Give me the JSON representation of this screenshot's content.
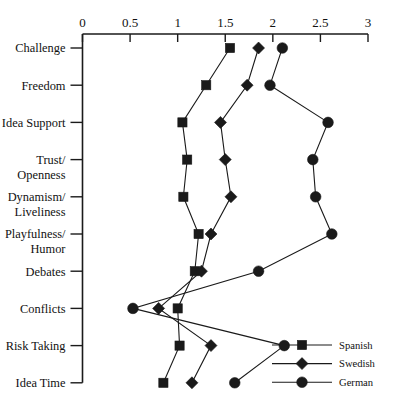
{
  "chart_data": {
    "type": "line",
    "title": "",
    "xlabel": "",
    "ylabel": "",
    "orientation": "horizontal",
    "grid": false,
    "legend_position": "bottom-right",
    "xlim": [
      0,
      3
    ],
    "xticks": [
      0,
      0.5,
      1,
      1.5,
      2,
      2.5,
      3
    ],
    "xtick_labels": [
      "0",
      "0.5",
      "1",
      "1.5",
      "2",
      "2.5",
      "3"
    ],
    "categories": [
      "Challenge",
      "Freedom",
      "Idea Support",
      "Trust/ Openness",
      "Dynamism/ Liveliness",
      "Playfulness/ Humor",
      "Debates",
      "Conflicts",
      "Risk Taking",
      "Idea Time"
    ],
    "category_lines": [
      [
        "Challenge"
      ],
      [
        "Freedom"
      ],
      [
        "Idea Support"
      ],
      [
        "Trust/",
        "Openness"
      ],
      [
        "Dynamism/",
        "Liveliness"
      ],
      [
        "Playfulness/",
        "Humor"
      ],
      [
        "Debates"
      ],
      [
        "Conflicts"
      ],
      [
        "Risk Taking"
      ],
      [
        "Idea Time"
      ]
    ],
    "series": [
      {
        "name": "Spanish",
        "marker": "square",
        "color": "#1a1a1a",
        "values": [
          1.55,
          1.3,
          1.05,
          1.1,
          1.06,
          1.22,
          1.18,
          1.0,
          1.02,
          0.85
        ]
      },
      {
        "name": "Swedish",
        "marker": "diamond",
        "color": "#1a1a1a",
        "values": [
          1.85,
          1.73,
          1.45,
          1.5,
          1.56,
          1.35,
          1.25,
          0.8,
          1.35,
          1.15
        ]
      },
      {
        "name": "German",
        "marker": "circle",
        "color": "#1a1a1a",
        "values": [
          2.1,
          1.97,
          2.58,
          2.42,
          2.45,
          2.62,
          1.85,
          0.53,
          2.12,
          1.6
        ]
      }
    ]
  },
  "legend": {
    "entries": [
      {
        "label": "Spanish",
        "marker": "square-marker"
      },
      {
        "label": "Swedish",
        "marker": "diamond-marker"
      },
      {
        "label": "German",
        "marker": "circle-marker"
      }
    ]
  }
}
